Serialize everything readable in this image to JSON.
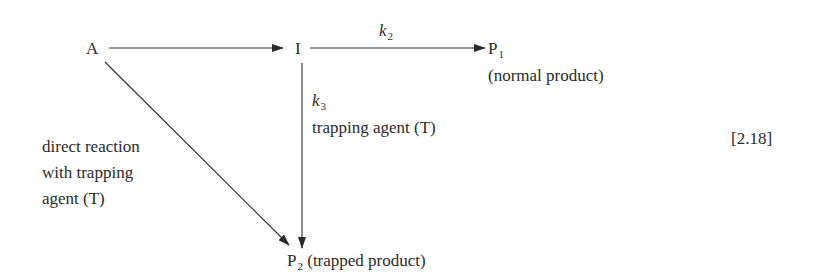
{
  "diagram": {
    "nodes": {
      "A": {
        "label": "A"
      },
      "I": {
        "label": "I"
      },
      "P1": {
        "label": "P",
        "subscript": "1",
        "description": "(normal product)"
      },
      "P2": {
        "label": "P",
        "subscript": "2",
        "description": "(trapped product)"
      }
    },
    "edges": {
      "A_to_I": {
        "from": "A",
        "to": "I",
        "label": ""
      },
      "I_to_P1": {
        "from": "I",
        "to": "P1",
        "rate_symbol": "k",
        "rate_subscript": "2"
      },
      "I_to_P2": {
        "from": "I",
        "to": "P2",
        "rate_symbol": "k",
        "rate_subscript": "3",
        "label": "trapping agent (T)"
      },
      "A_to_P2": {
        "from": "A",
        "to": "P2",
        "label_lines": [
          "direct reaction",
          "with trapping",
          "agent (T)"
        ]
      }
    },
    "equation_number": "[2.18]"
  }
}
